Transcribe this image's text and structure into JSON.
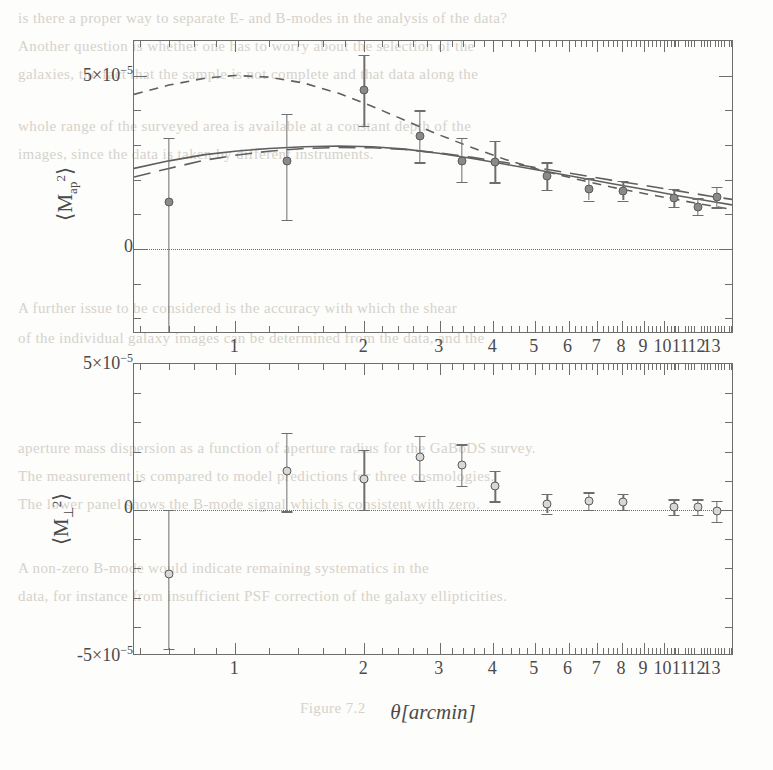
{
  "background_text": {
    "lines": [
      {
        "text": "is there a proper way to separate E- and B-modes in the analysis of the data?",
        "x": 18,
        "y": 10
      },
      {
        "text": "Another question is whether one has to worry about the selection of the",
        "x": 18,
        "y": 38
      },
      {
        "text": "galaxies, the fact that the sample is not complete and that data along the",
        "x": 18,
        "y": 66
      },
      {
        "text": "whole range of the surveyed area is available at a constant depth of the",
        "x": 18,
        "y": 118
      },
      {
        "text": "images, since the data is taken by different instruments.",
        "x": 18,
        "y": 146
      },
      {
        "text": "A further issue to be considered is the accuracy with which the shear",
        "x": 18,
        "y": 300
      },
      {
        "text": "of the individual galaxy images can be determined from the data, and the",
        "x": 18,
        "y": 330
      },
      {
        "text": "aperture mass dispersion as a function of aperture radius for the GaBoDS survey.",
        "x": 18,
        "y": 440
      },
      {
        "text": "The measurement is compared to model predictions for three cosmologies.",
        "x": 18,
        "y": 468
      },
      {
        "text": "The lower panel shows the B-mode signal which is consistent with zero.",
        "x": 18,
        "y": 496
      },
      {
        "text": "A non-zero B-mode would indicate remaining systematics in the",
        "x": 18,
        "y": 560
      },
      {
        "text": "data, for instance from insufficient PSF correction of the galaxy ellipticities.",
        "x": 18,
        "y": 588
      },
      {
        "text": "Figure 7.2",
        "x": 300,
        "y": 700
      }
    ]
  },
  "chart_data": [
    {
      "id": "aperture-mass-E-mode",
      "type": "scatter",
      "panel": "top",
      "ylabel": "⟨M²ap⟩",
      "xlabel": "",
      "xscale": "log",
      "xlim": [
        0.58,
        14.6
      ],
      "ylim": [
        -2.45e-05,
        6e-05
      ],
      "xticks_major": [
        1,
        2,
        3,
        4,
        5,
        6,
        7,
        8,
        9,
        10,
        11,
        12,
        13
      ],
      "xtick_labels": [
        "1",
        "2",
        "3",
        "4",
        "5",
        "6",
        "7",
        "8",
        "9",
        "10",
        "11",
        "12",
        "13"
      ],
      "yticks_labeled": [
        {
          "value": 5e-05,
          "label": "5×10⁻⁵"
        },
        {
          "value": 0,
          "label": "0"
        }
      ],
      "ytick_step": 1e-05,
      "zero_line": true,
      "points": [
        {
          "x": 0.7,
          "y": 1.35e-05,
          "yerr_lo": 3.75e-05,
          "yerr_hi": 1.85e-05
        },
        {
          "x": 1.32,
          "y": 2.55e-05,
          "yerr_lo": 1.7e-05,
          "yerr_hi": 1.35e-05
        },
        {
          "x": 2.0,
          "y": 4.6e-05,
          "yerr_lo": 1.05e-05,
          "yerr_hi": 1e-05
        },
        {
          "x": 2.7,
          "y": 3.25e-05,
          "yerr_lo": 7.5e-06,
          "yerr_hi": 7.5e-06
        },
        {
          "x": 3.38,
          "y": 2.55e-05,
          "yerr_lo": 6.2e-06,
          "yerr_hi": 6.6e-06
        },
        {
          "x": 4.05,
          "y": 2.5e-05,
          "yerr_lo": 5.8e-06,
          "yerr_hi": 6.2e-06
        },
        {
          "x": 5.35,
          "y": 2.1e-05,
          "yerr_lo": 4e-06,
          "yerr_hi": 4e-06
        },
        {
          "x": 6.7,
          "y": 1.72e-05,
          "yerr_lo": 3.2e-06,
          "yerr_hi": 3.2e-06
        },
        {
          "x": 8.05,
          "y": 1.68e-05,
          "yerr_lo": 2.8e-06,
          "yerr_hi": 2.8e-06
        },
        {
          "x": 10.6,
          "y": 1.48e-05,
          "yerr_lo": 2.6e-06,
          "yerr_hi": 2.6e-06
        },
        {
          "x": 12.0,
          "y": 1.22e-05,
          "yerr_lo": 2.4e-06,
          "yerr_hi": 2.4e-06
        },
        {
          "x": 13.3,
          "y": 1.5e-05,
          "yerr_lo": 3e-06,
          "yerr_hi": 3e-06
        }
      ],
      "model_curves": [
        {
          "name": "model-solid",
          "style": "solid",
          "x": [
            0.58,
            0.7,
            0.85,
            1.0,
            1.2,
            1.45,
            1.75,
            2.1,
            2.5,
            3.0,
            3.6,
            4.3,
            5.2,
            6.3,
            7.6,
            9.2,
            11.0,
            13.2,
            14.6
          ],
          "y": [
            2.3e-05,
            2.52e-05,
            2.7e-05,
            2.8e-05,
            2.88e-05,
            2.93e-05,
            2.95e-05,
            2.93e-05,
            2.86e-05,
            2.74e-05,
            2.59e-05,
            2.42e-05,
            2.24e-05,
            2.05e-05,
            1.86e-05,
            1.68e-05,
            1.5e-05,
            1.33e-05,
            1.24e-05
          ]
        },
        {
          "name": "model-long-dash",
          "style": "long-dash",
          "x": [
            0.58,
            0.7,
            0.85,
            1.0,
            1.2,
            1.45,
            1.75,
            2.1,
            2.5,
            3.0,
            3.6,
            4.3,
            5.2,
            6.3,
            7.6,
            9.2,
            11.0,
            13.2,
            14.6
          ],
          "y": [
            2.05e-05,
            2.3e-05,
            2.54e-05,
            2.68e-05,
            2.8e-05,
            2.88e-05,
            2.91e-05,
            2.9e-05,
            2.85e-05,
            2.75e-05,
            2.62e-05,
            2.47e-05,
            2.3e-05,
            2.13e-05,
            1.96e-05,
            1.8e-05,
            1.64e-05,
            1.48e-05,
            1.4e-05
          ]
        },
        {
          "name": "model-short-dash",
          "style": "short-dash",
          "x": [
            0.58,
            0.7,
            0.85,
            1.0,
            1.2,
            1.45,
            1.75,
            2.1,
            2.5,
            3.0,
            3.6,
            4.3,
            5.2,
            6.3,
            7.6,
            9.2,
            11.0,
            13.2,
            14.6
          ],
          "y": [
            4.45e-05,
            4.72e-05,
            4.92e-05,
            5e-05,
            4.95e-05,
            4.78e-05,
            4.48e-05,
            4.1e-05,
            3.7e-05,
            3.28e-05,
            2.9e-05,
            2.56e-05,
            2.25e-05,
            1.99e-05,
            1.76e-05,
            1.56e-05,
            1.38e-05,
            1.2e-05,
            1.11e-05
          ]
        }
      ]
    },
    {
      "id": "aperture-mass-B-mode",
      "type": "scatter",
      "panel": "bottom",
      "ylabel": "⟨M²⊥⟩",
      "xlabel": "θ[arcmin]",
      "xscale": "log",
      "xlim": [
        0.58,
        14.6
      ],
      "ylim": [
        -5e-05,
        5e-05
      ],
      "xticks_major": [
        1,
        2,
        3,
        4,
        5,
        6,
        7,
        8,
        9,
        10,
        11,
        12,
        13
      ],
      "xtick_labels": [
        "1",
        "2",
        "3",
        "4",
        "5",
        "6",
        "7",
        "8",
        "9",
        "10",
        "11",
        "12",
        "13"
      ],
      "yticks_labeled": [
        {
          "value": 5e-05,
          "label": "5×10⁻⁵"
        },
        {
          "value": 0,
          "label": "0"
        },
        {
          "value": -5e-05,
          "label": "-5×10⁻⁵"
        }
      ],
      "ytick_step": 1e-05,
      "zero_line": true,
      "points": [
        {
          "x": 0.7,
          "y": -2.2e-05,
          "yerr_lo": 2.55e-05,
          "yerr_hi": 2.2e-05
        },
        {
          "x": 1.32,
          "y": 1.35e-05,
          "yerr_lo": 1.4e-05,
          "yerr_hi": 1.3e-05
        },
        {
          "x": 2.0,
          "y": 1.05e-05,
          "yerr_lo": 1.05e-05,
          "yerr_hi": 1e-05
        },
        {
          "x": 2.7,
          "y": 1.8e-05,
          "yerr_lo": 8e-06,
          "yerr_hi": 7.5e-06
        },
        {
          "x": 3.38,
          "y": 1.55e-05,
          "yerr_lo": 7.2e-06,
          "yerr_hi": 7e-06
        },
        {
          "x": 4.05,
          "y": 8.2e-06,
          "yerr_lo": 5.2e-06,
          "yerr_hi": 5.2e-06
        },
        {
          "x": 5.35,
          "y": 2.2e-06,
          "yerr_lo": 3.4e-06,
          "yerr_hi": 3.4e-06
        },
        {
          "x": 6.7,
          "y": 3e-06,
          "yerr_lo": 3e-06,
          "yerr_hi": 3e-06
        },
        {
          "x": 8.05,
          "y": 2.8e-06,
          "yerr_lo": 2.8e-06,
          "yerr_hi": 2.8e-06
        },
        {
          "x": 10.6,
          "y": 1e-06,
          "yerr_lo": 2.6e-06,
          "yerr_hi": 2.6e-06
        },
        {
          "x": 12.0,
          "y": 1e-06,
          "yerr_lo": 2.6e-06,
          "yerr_hi": 2.6e-06
        },
        {
          "x": 13.3,
          "y": -5e-07,
          "yerr_lo": 3.6e-06,
          "yerr_hi": 3.6e-06
        }
      ]
    }
  ],
  "colors": {
    "ink": "#4a4a4a",
    "frame": "#6e6e6e",
    "marker_fill": "#8a8a8a",
    "marker_edge": "#5b5b5b",
    "marker_open_fill": "#d8d8d6",
    "ghost": "#cfcbc4",
    "page": "#fdfdfb"
  }
}
